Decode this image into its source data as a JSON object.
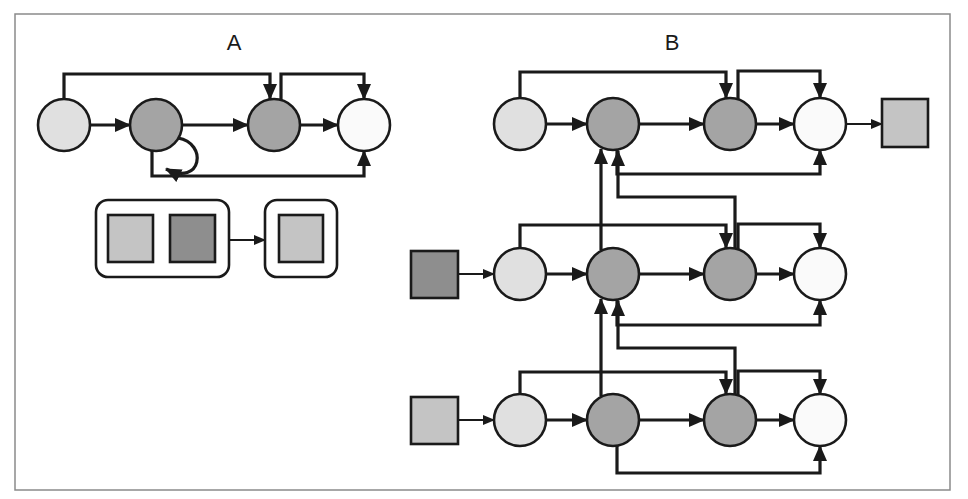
{
  "figure": {
    "frame": {
      "x": 15,
      "y": 14,
      "width": 935,
      "height": 476,
      "border_color": "#8a8a8a"
    },
    "colors": {
      "stroke": "#1a1a1a",
      "light": "#e0e0e0",
      "dark": "#a4a4a4",
      "white": "#fafafa",
      "square_light": "#c4c4c4",
      "square_dark": "#8e8e8e"
    }
  },
  "panels": [
    {
      "id": "A",
      "label": "A",
      "label_pos": {
        "x": 234,
        "y": 30
      },
      "chain": {
        "y": 125,
        "r": 26,
        "nodes": [
          {
            "x": 64,
            "fill": "light",
            "name": "node-a1"
          },
          {
            "x": 156,
            "fill": "dark",
            "name": "node-a2"
          },
          {
            "x": 274,
            "fill": "dark",
            "name": "node-a3"
          },
          {
            "x": 364,
            "fill": "white",
            "name": "node-a4"
          }
        ],
        "self_loop_on": 1,
        "skip_top": [
          {
            "from": 0,
            "to": 2,
            "y": 74
          },
          {
            "from": 2,
            "to": 3,
            "y": 74
          }
        ],
        "skip_bottom": [
          {
            "from": 1,
            "to": 3,
            "y": 176
          }
        ]
      },
      "legend": {
        "group_box": {
          "x": 96,
          "y": 200,
          "w": 133,
          "h": 77
        },
        "group_squares": [
          {
            "x": 108,
            "y": 215,
            "w": 45,
            "h": 47,
            "fill": "square_light"
          },
          {
            "x": 170,
            "y": 215,
            "w": 45,
            "h": 47,
            "fill": "square_dark"
          }
        ],
        "target_box": {
          "x": 265,
          "y": 200,
          "w": 72,
          "h": 77
        },
        "target_square": {
          "x": 279,
          "y": 215,
          "w": 44,
          "h": 47,
          "fill": "square_light"
        },
        "arrow_y": 240
      }
    },
    {
      "id": "B",
      "label": "B",
      "label_pos": {
        "x": 672,
        "y": 30
      },
      "rows": [
        {
          "y": 124,
          "top_y": 72,
          "bottom_y": 174,
          "input_square": null,
          "output_square": {
            "x": 882,
            "y": 99,
            "w": 46,
            "h": 48,
            "fill": "square_light"
          }
        },
        {
          "y": 274,
          "top_y": 225,
          "bottom_y": 325,
          "input_square": {
            "x": 411,
            "y": 251,
            "w": 47,
            "h": 47,
            "fill": "square_dark"
          },
          "output_square": null
        },
        {
          "y": 420,
          "top_y": 372,
          "bottom_y": 473,
          "input_square": {
            "x": 411,
            "y": 397,
            "w": 47,
            "h": 47,
            "fill": "square_light"
          },
          "output_square": null
        }
      ],
      "node_x": [
        520,
        613,
        730,
        820
      ],
      "node_fill": [
        "light",
        "dark",
        "dark",
        "white"
      ],
      "r": 26
    }
  ]
}
